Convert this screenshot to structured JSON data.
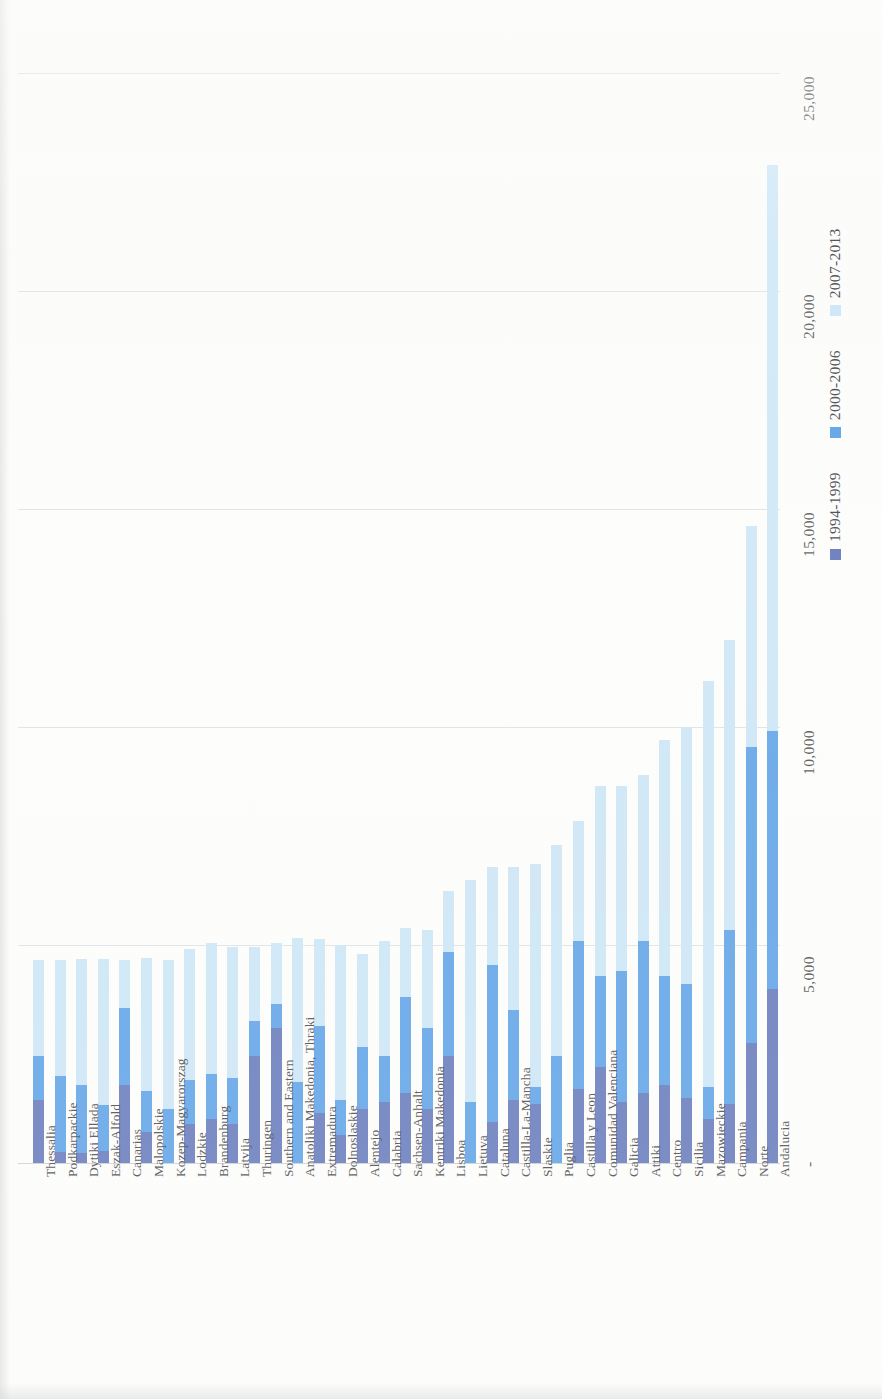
{
  "chart_data": {
    "type": "bar",
    "subtype": "stacked-bar",
    "orientation": "vertical-bars-rotated-90",
    "title": "",
    "xlabel": "",
    "ylabel": "",
    "ylim": [
      0,
      26500
    ],
    "grid": true,
    "gridlines": [
      5000,
      10000,
      15000,
      20000,
      25000
    ],
    "ytick_labels": [
      "-",
      "5,000",
      "10,000",
      "15,000",
      "20,000",
      "25,000"
    ],
    "yticks": [
      0,
      5000,
      10000,
      15000,
      20000,
      25000
    ],
    "legend_position": "right",
    "categories": [
      "Thessalia",
      "Podkarpackie",
      "Dytiki Ellada",
      "Eszak-Alfold",
      "Canarias",
      "Malopolskie",
      "Kozep-Magyarorszag",
      "Lodzkie",
      "Brandenburg",
      "Latvija",
      "Thuringen",
      "Southern and Eastern",
      "Anatoliki Makedonia, Thraki",
      "Extremadura",
      "Dolnoslaskie",
      "Alentejo",
      "Calabria",
      "Sachsen-Anhalt",
      "Kentriki Makedonia",
      "Lisboa",
      "Lietuva",
      "Cataluna",
      "Castilla-La-Mancha",
      "Slaskie",
      "Puglia",
      "Castilla y Leon",
      "Comunidad Valenciana",
      "Galicia",
      "Attiki",
      "Centro",
      "Sicilia",
      "Mazowieckie",
      "Campania",
      "Norte",
      "Andalucia"
    ],
    "series": [
      {
        "name": "1994-1999",
        "color": "#7183c0",
        "values": [
          1450,
          250,
          230,
          280,
          1800,
          700,
          0,
          900,
          1000,
          900,
          2450,
          3100,
          0,
          1150,
          650,
          1250,
          1400,
          1600,
          1250,
          2450,
          0,
          950,
          1450,
          1350,
          0,
          1700,
          2200,
          1400,
          1600,
          1800,
          1500,
          1000,
          1350,
          2750,
          4000
        ]
      },
      {
        "name": "2000-2006",
        "color": "#6aa9e9",
        "values": [
          1000,
          1750,
          1550,
          1050,
          1750,
          950,
          1250,
          1000,
          1050,
          1050,
          800,
          550,
          1850,
          2000,
          800,
          1400,
          1050,
          2200,
          1850,
          2400,
          1400,
          3600,
          2050,
          400,
          2450,
          3400,
          2100,
          3000,
          3500,
          2500,
          2600,
          750,
          4000,
          6800,
          5900
        ]
      },
      {
        "name": "2007-2013",
        "color": "#cfe7f7",
        "values": [
          2200,
          2650,
          2900,
          3350,
          1100,
          3050,
          3400,
          3000,
          3000,
          3000,
          1700,
          1400,
          3300,
          2000,
          3550,
          2150,
          2650,
          1600,
          2250,
          1400,
          5100,
          2250,
          3300,
          5100,
          4850,
          2750,
          4350,
          4250,
          3800,
          5400,
          5900,
          9300,
          6650,
          5050,
          13000
        ]
      }
    ],
    "legend": [
      "1994-1999",
      "2000-2006",
      "2007-2013"
    ]
  },
  "axis": {
    "tick_zero": "-",
    "tick_5000": "5,000",
    "tick_10000": "10,000",
    "tick_15000": "15,000",
    "tick_20000": "20,000",
    "tick_25000": "25,000"
  }
}
